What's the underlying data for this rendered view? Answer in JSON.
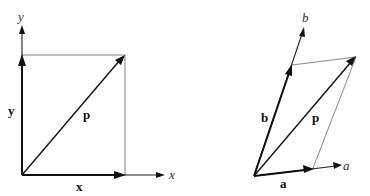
{
  "figure": {
    "left_panel": {
      "title": "Cartesian decomposition",
      "axis_labels": {
        "x": "x",
        "y": "y"
      },
      "vector_labels": {
        "x": "x",
        "y": "y",
        "p": "p"
      }
    },
    "right_panel": {
      "title": "Oblique decomposition",
      "axis_labels": {
        "a": "a",
        "b": "b"
      },
      "vector_labels": {
        "a": "a",
        "b": "b",
        "p": "p"
      }
    }
  }
}
